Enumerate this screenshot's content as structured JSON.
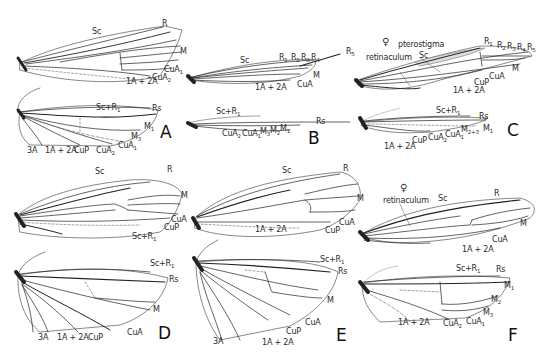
{
  "figure": {
    "panels": [
      {
        "id": "A",
        "label": "A",
        "forewing_labels": [
          "Sc",
          "R",
          "M",
          "CuA1",
          "CuA2",
          "1A+2A"
        ],
        "hindwing_labels": [
          "Sc+R1",
          "Rs",
          "M1",
          "M3",
          "CuA1",
          "CuA2",
          "CuP",
          "1A+2A",
          "3A"
        ]
      },
      {
        "id": "B",
        "label": "B",
        "forewing_labels": [
          "Sc",
          "R1",
          "R2",
          "R3",
          "R4",
          "R5",
          "M",
          "CuA",
          "1A+2A"
        ],
        "hindwing_labels": [
          "Sc+R1",
          "Rs",
          "M1",
          "M2",
          "M3",
          "CuA1",
          "CuA2"
        ]
      },
      {
        "id": "C",
        "label": "C",
        "female_symbol": "♀",
        "forewing_labels": [
          "pterostigma",
          "retinaculum",
          "Sc",
          "R1",
          "R2",
          "R3",
          "R4",
          "R5",
          "M",
          "CuA",
          "CuP",
          "1A+2A"
        ],
        "hindwing_labels": [
          "Sc+R1",
          "Rs",
          "M1",
          "M2+3",
          "CuA1",
          "CuA2",
          "CuP",
          "1A+2A"
        ]
      },
      {
        "id": "D",
        "label": "D",
        "forewing_labels": [
          "Sc",
          "R",
          "M",
          "CuA",
          "CuP",
          "Sc+R1"
        ],
        "hindwing_labels": [
          "Sc+R1",
          "Rs",
          "M",
          "CuA",
          "CuP",
          "1A+2A",
          "3A"
        ]
      },
      {
        "id": "E",
        "label": "E",
        "forewing_labels": [
          "Sc",
          "R",
          "M",
          "CuA",
          "CuP",
          "1A+2A"
        ],
        "hindwing_labels": [
          "Sc+R1",
          "Rs",
          "M",
          "CuA",
          "CuP",
          "1A+2A",
          "3A"
        ]
      },
      {
        "id": "F",
        "label": "F",
        "female_symbol": "♀",
        "forewing_labels": [
          "retinaculum",
          "Sc",
          "R",
          "M",
          "CuA",
          "1A+2A"
        ],
        "hindwing_labels": [
          "Sc+R1",
          "Rs",
          "M1",
          "M2",
          "M3",
          "CuA1",
          "CuA2",
          "1A+2A"
        ]
      }
    ]
  },
  "labels": {
    "A_Sc": "Sc",
    "A_R": "R",
    "A_M": "M",
    "A_CuA1": "CuA",
    "A_CuA2": "CuA",
    "A_1A2A": "1A + 2A",
    "A_h_ScR1": "Sc+R",
    "A_h_Rs": "Rs",
    "A_h_M1": "M",
    "A_h_M3": "M",
    "A_h_CuA1": "CuA",
    "A_h_CuA2": "CuA",
    "A_h_CuP": "CuP",
    "A_h_1A2A": "1A + 2A",
    "A_h_3A": "3A",
    "B_Sc": "Sc",
    "B_R1": "R",
    "B_R2": "R",
    "B_R3": "R",
    "B_R4": "R",
    "B_R5": "R",
    "B_M": "M",
    "B_CuA": "CuA",
    "B_1A2A": "1A + 2A",
    "B_h_ScR1": "Sc+R",
    "B_h_Rs": "Rs",
    "B_h_CuA2": "CuA",
    "B_h_CuA1": "CuA",
    "B_h_M3": "M",
    "B_h_M2": "M",
    "B_h_M1": "M",
    "C_pterostigma": "pterostigma",
    "C_retinaculum": "retinaculum",
    "C_Sc": "Sc",
    "C_R1": "R",
    "C_R2": "R",
    "C_R3": "R",
    "C_R4": "R",
    "C_R5": "R",
    "C_M": "M",
    "C_CuA": "CuA",
    "C_CuP": "CuP",
    "C_1A2A": "1A + 2A",
    "C_h_ScR1": "Sc+R",
    "C_h_Rs": "Rs",
    "C_h_M1": "M",
    "C_h_M23": "M",
    "C_h_CuA1": "CuA",
    "C_h_CuA2": "CuA",
    "C_h_CuP": "CuP",
    "C_h_1A2A": "1A + 2A",
    "D_Sc": "Sc",
    "D_R": "R",
    "D_M": "M",
    "D_CuA": "CuA",
    "D_CuP": "CuP",
    "D_ScR1": "Sc+R",
    "D_h_ScR1": "Sc+R",
    "D_h_Rs": "Rs",
    "D_h_M": "M",
    "D_h_CuA": "CuA",
    "D_h_CuP": "CuP",
    "D_h_1A2A": "1A + 2A",
    "D_h_3A": "3A",
    "E_Sc": "Sc",
    "E_R": "R",
    "E_M": "M",
    "E_CuA": "CuA",
    "E_CuP": "CuP",
    "E_1A2A": "1A + 2A",
    "E_h_ScR1": "Sc+R",
    "E_h_Rs": "Rs",
    "E_h_M": "M",
    "E_h_CuA": "CuA",
    "E_h_CuP": "CuP",
    "E_h_1A2A": "1A + 2A",
    "E_h_3A": "3A",
    "F_retinaculum": "retinaculum",
    "F_Sc": "Sc",
    "F_R": "R",
    "F_M": "M",
    "F_CuA": "CuA",
    "F_1A2A": "1A + 2A",
    "F_h_ScR1": "Sc+R",
    "F_h_Rs": "Rs",
    "F_h_M1": "M",
    "F_h_M2": "M",
    "F_h_M3": "M",
    "F_h_CuA1": "CuA",
    "F_h_CuA2": "CuA",
    "F_h_1A2A": "1A + 2A",
    "female": "♀"
  },
  "subscripts": {
    "one": "1",
    "two": "2",
    "three": "3",
    "four": "4",
    "five": "5",
    "two_three": "2+3"
  },
  "colors": {
    "vein": "#1a1a1a",
    "outline": "#555555",
    "text": "#2a2a2a",
    "background": "#ffffff"
  }
}
